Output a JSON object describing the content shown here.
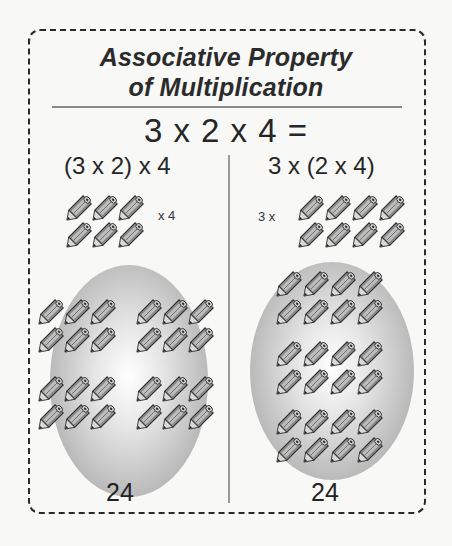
{
  "title": {
    "line1": "Associative Property",
    "line2": "of Multiplication"
  },
  "equation": "3 x 2 x 4 =",
  "left": {
    "expression": "(3 x 2) x 4",
    "group_label": "x 4",
    "group_size": 6,
    "group_layout": "2 rows x 3",
    "oval_groups": 4,
    "result": "24"
  },
  "right": {
    "expression": "3 x (2 x 4)",
    "group_label": "3 x",
    "group_size": 8,
    "group_layout": "2 rows x 4",
    "oval_groups": 3,
    "result": "24"
  },
  "icons": {
    "item": "pencil-icon"
  },
  "colors": {
    "border": "#2a2a2a",
    "divider": "#8a8a8a",
    "oval_light": "#ffffff",
    "oval_dark": "#9a9a9a",
    "pencil_body": "#7a7a7a"
  }
}
